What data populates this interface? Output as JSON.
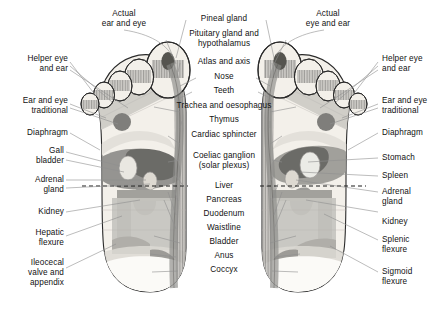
{
  "diagram": {
    "type": "anatomical-diagram",
    "background_color": "#ffffff",
    "leader_line_color": "#8f8f8f",
    "outline_color": "#2b2b2b",
    "waistline_marker": {
      "style": "dashed",
      "color": "#1a1a1a",
      "label": "Waistline"
    },
    "palette": {
      "skin": "#f2efe9",
      "light_grey": "#d8d6d1",
      "mid_grey": "#b3b2ae",
      "dark_grey": "#8c8b88",
      "darker_grey": "#6e6d6b",
      "darkest_grey": "#4f4e4c",
      "hatch": "#9a9895"
    }
  },
  "labels": {
    "left_column": [
      {
        "id": "helper-eye-and-ear",
        "text": "Helper eye\nand ear"
      },
      {
        "id": "ear-and-eye-traditional",
        "text": "Ear and eye\ntraditional"
      },
      {
        "id": "diaphragm-left",
        "text": "Diaphragm"
      },
      {
        "id": "gall-bladder",
        "text": "Gall\nbladder"
      },
      {
        "id": "adrenal-gland-left",
        "text": "Adrenal\ngland"
      },
      {
        "id": "kidney-left",
        "text": "Kidney"
      },
      {
        "id": "hepatic-flexure",
        "text": "Hepatic\nflexure"
      },
      {
        "id": "ileocecal-valve-and-appendix",
        "text": "Ileocecal\nvalve and\nappendix"
      }
    ],
    "right_column": [
      {
        "id": "helper-eye-and-ear-right",
        "text": "Helper eye\nand ear"
      },
      {
        "id": "ear-and-eye-traditional-right",
        "text": "Ear and eye\ntraditional"
      },
      {
        "id": "diaphragm-right",
        "text": "Diaphragm"
      },
      {
        "id": "stomach",
        "text": "Stomach"
      },
      {
        "id": "spleen",
        "text": "Spleen"
      },
      {
        "id": "adrenal-gland-right",
        "text": "Adrenal\ngland"
      },
      {
        "id": "kidney-right",
        "text": "Kidney"
      },
      {
        "id": "splenic-flexure",
        "text": "Splenic\nflexure"
      },
      {
        "id": "sigmoid-flexure",
        "text": "Sigmoid\nflexure"
      }
    ],
    "top_left": {
      "id": "actual-ear-and-eye",
      "text": "Actual\near and eye"
    },
    "top_right": {
      "id": "actual-eye-and-ear",
      "text": "Actual\neye and ear"
    },
    "center_column": [
      {
        "id": "pineal-gland",
        "text": "Pineal gland"
      },
      {
        "id": "pituitary-gland-and-hypothalamus",
        "text": "Pituitary gland and\nhypothalamus"
      },
      {
        "id": "atlas-and-axis",
        "text": "Atlas and axis"
      },
      {
        "id": "nose",
        "text": "Nose"
      },
      {
        "id": "teeth",
        "text": "Teeth"
      },
      {
        "id": "trachea-and-oesophagus",
        "text": "Trachea and oesophagus"
      },
      {
        "id": "thymus",
        "text": "Thymus"
      },
      {
        "id": "cardiac-sphincter",
        "text": "Cardiac sphincter"
      },
      {
        "id": "coeliac-ganglion-solar-plexus",
        "text": "Coeliac ganglion\n(solar plexus)"
      },
      {
        "id": "liver",
        "text": "Liver"
      },
      {
        "id": "pancreas",
        "text": "Pancreas"
      },
      {
        "id": "duodenum",
        "text": "Duodenum"
      },
      {
        "id": "waistline",
        "text": "Waistline"
      },
      {
        "id": "bladder",
        "text": "Bladder"
      },
      {
        "id": "anus",
        "text": "Anus"
      },
      {
        "id": "coccyx",
        "text": "Coccyx"
      }
    ]
  }
}
